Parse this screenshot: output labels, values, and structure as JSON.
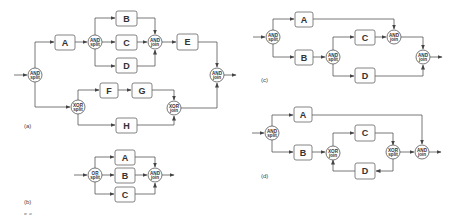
{
  "figure": {
    "caption_fragment": "5.6",
    "panels": [
      {
        "id": "a",
        "label": "(a)",
        "tasks": [
          "A",
          "B",
          "C",
          "D",
          "E",
          "F",
          "G",
          "H"
        ],
        "gateways": [
          {
            "kind": "AND",
            "role": "split"
          },
          {
            "kind": "AND",
            "role": "split"
          },
          {
            "kind": "AND",
            "role": "join"
          },
          {
            "kind": "XOR",
            "role": "split"
          },
          {
            "kind": "XOR",
            "role": "join"
          },
          {
            "kind": "AND",
            "role": "join"
          }
        ]
      },
      {
        "id": "b",
        "label": "(b)",
        "tasks": [
          "A",
          "B",
          "C"
        ],
        "gateways": [
          {
            "kind": "OR",
            "role": "split"
          },
          {
            "kind": "AND",
            "role": "join"
          }
        ]
      },
      {
        "id": "c",
        "label": "(c)",
        "tasks": [
          "A",
          "B",
          "C",
          "D"
        ],
        "gateways": [
          {
            "kind": "AND",
            "role": "split"
          },
          {
            "kind": "AND",
            "role": "split"
          },
          {
            "kind": "AND",
            "role": "join"
          },
          {
            "kind": "AND",
            "role": "join"
          }
        ]
      },
      {
        "id": "d",
        "label": "(d)",
        "tasks": [
          "A",
          "B",
          "C",
          "D"
        ],
        "gateways": [
          {
            "kind": "AND",
            "role": "split"
          },
          {
            "kind": "XOR",
            "role": "join"
          },
          {
            "kind": "XOR",
            "role": "split"
          },
          {
            "kind": "AND",
            "role": "join"
          }
        ]
      }
    ]
  }
}
